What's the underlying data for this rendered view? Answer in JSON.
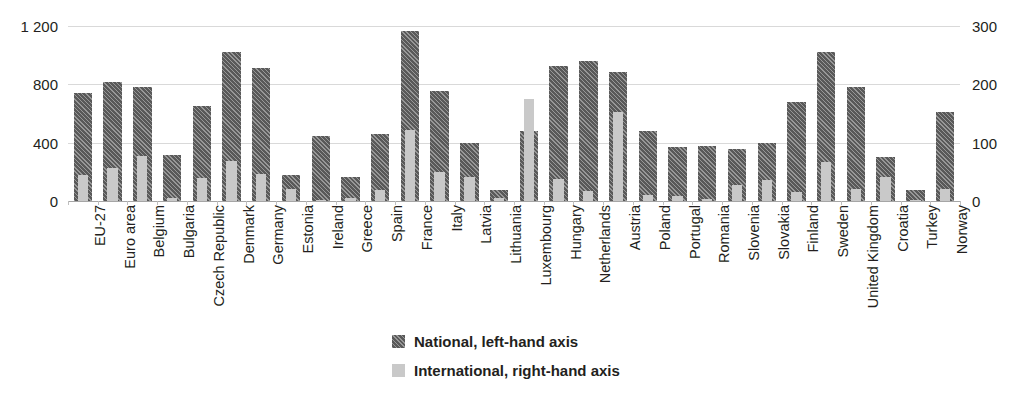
{
  "chart_data": {
    "type": "bar",
    "title": "",
    "subtitle": "",
    "xlabel": "",
    "ylabel": "",
    "grid": true,
    "legend_position": "bottom-center",
    "dual_axis": true,
    "left_axis": {
      "label": "",
      "ylim": [
        0,
        1200
      ],
      "ticks": [
        0,
        400,
        800,
        1200
      ],
      "tick_labels": [
        "0",
        "400",
        "800",
        "1 200"
      ]
    },
    "right_axis": {
      "label": "",
      "ylim": [
        0,
        300
      ],
      "ticks": [
        0,
        100,
        200,
        300
      ],
      "tick_labels": [
        "0",
        "100",
        "200",
        "300"
      ]
    },
    "categories": [
      "EU-27",
      "Euro area",
      "Belgium",
      "Bulgaria",
      "Czech Republic",
      "Denmark",
      "Germany",
      "Estonia",
      "Ireland",
      "Greece",
      "Spain",
      "France",
      "Italy",
      "Latvia",
      "Lithuania",
      "Luxembourg",
      "Hungary",
      "Netherlands",
      "Austria",
      "Poland",
      "Portugal",
      "Romania",
      "Slovenia",
      "Slovakia",
      "Finland",
      "Sweden",
      "United Kingdom",
      "Croatia",
      "Turkey",
      "Norway"
    ],
    "series": [
      {
        "name": "National, left-hand axis",
        "axis": "left",
        "color": "#595959",
        "pattern": "diagonal-hatch",
        "values": [
          740,
          815,
          785,
          315,
          650,
          1025,
          915,
          180,
          445,
          165,
          460,
          1165,
          755,
          400,
          75,
          480,
          925,
          960,
          885,
          480,
          370,
          380,
          355,
          395,
          680,
          1025,
          780,
          305,
          75,
          610
        ]
      },
      {
        "name": "International, right-hand axis",
        "axis": "right",
        "color": "#c9c9c9",
        "pattern": "solid",
        "values": [
          44,
          56,
          78,
          6,
          39,
          68,
          46,
          21,
          1,
          5,
          19,
          122,
          50,
          41,
          6,
          175,
          37,
          18,
          152,
          10,
          9,
          4,
          27,
          36,
          16,
          67,
          20,
          42,
          2,
          20
        ]
      }
    ]
  },
  "legend": {
    "items": [
      {
        "label": "National, left-hand axis",
        "swatch": "national"
      },
      {
        "label": "International, right-hand axis",
        "swatch": "international"
      }
    ]
  },
  "top_clip_text": "clipped"
}
